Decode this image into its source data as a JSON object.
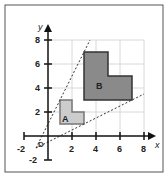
{
  "diagram": {
    "type": "enlargement",
    "axes": {
      "x_label": "x",
      "y_label": "y",
      "x_ticks": [
        "-2",
        "2",
        "4",
        "6",
        "8"
      ],
      "y_ticks": [
        "8",
        "6",
        "4",
        "2",
        "-2"
      ],
      "x_range": [
        -2,
        8
      ],
      "y_range": [
        -2,
        8
      ]
    },
    "center": {
      "label": "D",
      "x": -1,
      "y": -1
    },
    "shapes": [
      {
        "label": "A",
        "color": "#cccccc",
        "vertices": [
          [
            1,
            1
          ],
          [
            3,
            1
          ],
          [
            3,
            2
          ],
          [
            2,
            2
          ],
          [
            2,
            3
          ],
          [
            1,
            3
          ]
        ]
      },
      {
        "label": "B",
        "color": "#8a8a8a",
        "vertices": [
          [
            3,
            3
          ],
          [
            7,
            3
          ],
          [
            7,
            5
          ],
          [
            5,
            5
          ],
          [
            5,
            7
          ],
          [
            3,
            7
          ]
        ]
      }
    ],
    "rays": [
      {
        "from": [
          -1,
          -1
        ],
        "to": [
          3.5,
          8
        ]
      },
      {
        "from": [
          -1,
          -1
        ],
        "to": [
          8,
          3.5
        ]
      }
    ]
  }
}
